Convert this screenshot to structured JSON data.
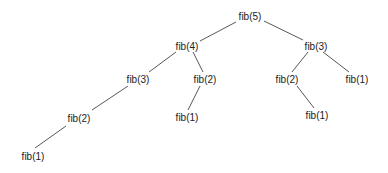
{
  "diagram": {
    "type": "tree",
    "line_color": "#444444",
    "nodes": [
      {
        "id": "n0",
        "label": "fib(5)",
        "x": 250,
        "y": 16
      },
      {
        "id": "n1",
        "label": "fib(4)",
        "x": 187,
        "y": 46
      },
      {
        "id": "n2",
        "label": "fib(3)",
        "x": 316,
        "y": 46
      },
      {
        "id": "n3",
        "label": "fib(3)",
        "x": 138,
        "y": 79
      },
      {
        "id": "n4",
        "label": "fib(2)",
        "x": 205,
        "y": 79
      },
      {
        "id": "n5",
        "label": "fib(2)",
        "x": 287,
        "y": 79
      },
      {
        "id": "n6",
        "label": "fib(1)",
        "x": 357,
        "y": 79
      },
      {
        "id": "n7",
        "label": "fib(2)",
        "x": 79,
        "y": 118
      },
      {
        "id": "n8",
        "label": "fib(1)",
        "x": 187,
        "y": 117
      },
      {
        "id": "n9",
        "label": "fib(1)",
        "x": 317,
        "y": 115
      },
      {
        "id": "n10",
        "label": "fib(1)",
        "x": 33,
        "y": 156
      }
    ],
    "edges": [
      {
        "x1": 236,
        "y1": 22,
        "x2": 200,
        "y2": 41
      },
      {
        "x1": 264,
        "y1": 21,
        "x2": 303,
        "y2": 40
      },
      {
        "x1": 176,
        "y1": 52,
        "x2": 149,
        "y2": 72
      },
      {
        "x1": 193,
        "y1": 52,
        "x2": 203,
        "y2": 72
      },
      {
        "x1": 308,
        "y1": 52,
        "x2": 292,
        "y2": 72
      },
      {
        "x1": 323,
        "y1": 52,
        "x2": 349,
        "y2": 72
      },
      {
        "x1": 128,
        "y1": 86,
        "x2": 92,
        "y2": 110
      },
      {
        "x1": 200,
        "y1": 86,
        "x2": 188,
        "y2": 110
      },
      {
        "x1": 297,
        "y1": 86,
        "x2": 314,
        "y2": 108
      },
      {
        "x1": 66,
        "y1": 126,
        "x2": 35,
        "y2": 148
      }
    ]
  }
}
